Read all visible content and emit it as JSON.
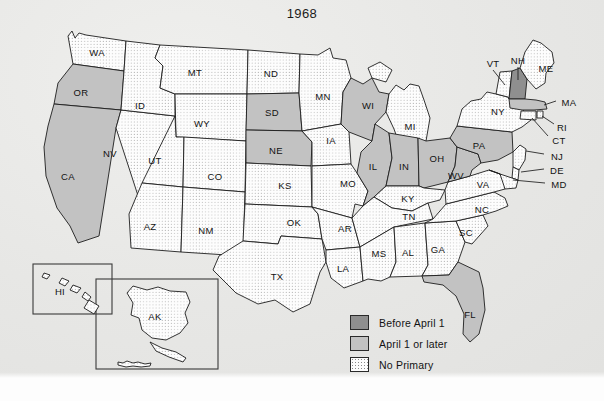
{
  "map": {
    "title": "1968",
    "legend": {
      "items": [
        {
          "label": "Before April 1",
          "swatch": "before",
          "color": "#8f8f8f"
        },
        {
          "label": "April 1 or later",
          "swatch": "after",
          "color": "#c2c2c2"
        },
        {
          "label": "No Primary",
          "swatch": "none",
          "color": "#fdfdfd"
        }
      ]
    },
    "categories": {
      "before_april_1": [
        "NH"
      ],
      "april_1_or_later": [
        "CA",
        "OR",
        "SD",
        "NE",
        "WI",
        "IL",
        "IN",
        "OH",
        "WV",
        "PA",
        "MA",
        "FL"
      ],
      "no_primary": [
        "WA",
        "ID",
        "MT",
        "ND",
        "MN",
        "WY",
        "NV",
        "UT",
        "CO",
        "KS",
        "IA",
        "MO",
        "AZ",
        "NM",
        "OK",
        "AR",
        "TX",
        "LA",
        "MS",
        "AL",
        "GA",
        "SC",
        "NC",
        "TN",
        "KY",
        "MI",
        "VA",
        "NY",
        "VT",
        "ME",
        "RI",
        "CT",
        "NJ",
        "DE",
        "MD",
        "AK",
        "HI"
      ]
    },
    "states": [
      {
        "code": "WA",
        "name": "Washington",
        "status": "no_primary",
        "x": 97,
        "y": 52
      },
      {
        "code": "OR",
        "name": "Oregon",
        "status": "april_1_or_later",
        "x": 81,
        "y": 92
      },
      {
        "code": "CA",
        "name": "California",
        "status": "april_1_or_later",
        "x": 68,
        "y": 176
      },
      {
        "code": "ID",
        "name": "Idaho",
        "status": "no_primary",
        "x": 140,
        "y": 105
      },
      {
        "code": "NV",
        "name": "Nevada",
        "status": "no_primary",
        "x": 110,
        "y": 153
      },
      {
        "code": "MT",
        "name": "Montana",
        "status": "no_primary",
        "x": 195,
        "y": 72
      },
      {
        "code": "WY",
        "name": "Wyoming",
        "status": "no_primary",
        "x": 202,
        "y": 123
      },
      {
        "code": "UT",
        "name": "Utah",
        "status": "no_primary",
        "x": 155,
        "y": 160
      },
      {
        "code": "AZ",
        "name": "Arizona",
        "status": "no_primary",
        "x": 150,
        "y": 226
      },
      {
        "code": "CO",
        "name": "Colorado",
        "status": "no_primary",
        "x": 215,
        "y": 176
      },
      {
        "code": "NM",
        "name": "New Mexico",
        "status": "no_primary",
        "x": 206,
        "y": 230
      },
      {
        "code": "ND",
        "name": "North Dakota",
        "status": "no_primary",
        "x": 271,
        "y": 73
      },
      {
        "code": "SD",
        "name": "South Dakota",
        "status": "april_1_or_later",
        "x": 272,
        "y": 112
      },
      {
        "code": "NE",
        "name": "Nebraska",
        "status": "april_1_or_later",
        "x": 276,
        "y": 150
      },
      {
        "code": "KS",
        "name": "Kansas",
        "status": "no_primary",
        "x": 285,
        "y": 185
      },
      {
        "code": "OK",
        "name": "Oklahoma",
        "status": "no_primary",
        "x": 294,
        "y": 222
      },
      {
        "code": "TX",
        "name": "Texas",
        "status": "no_primary",
        "x": 277,
        "y": 276
      },
      {
        "code": "MN",
        "name": "Minnesota",
        "status": "no_primary",
        "x": 323,
        "y": 96
      },
      {
        "code": "IA",
        "name": "Iowa",
        "status": "no_primary",
        "x": 331,
        "y": 140
      },
      {
        "code": "MO",
        "name": "Missouri",
        "status": "no_primary",
        "x": 348,
        "y": 183
      },
      {
        "code": "AR",
        "name": "Arkansas",
        "status": "no_primary",
        "x": 345,
        "y": 228
      },
      {
        "code": "LA",
        "name": "Louisiana",
        "status": "no_primary",
        "x": 343,
        "y": 268
      },
      {
        "code": "WI",
        "name": "Wisconsin",
        "status": "april_1_or_later",
        "x": 368,
        "y": 105
      },
      {
        "code": "MI",
        "name": "Michigan",
        "status": "no_primary",
        "x": 410,
        "y": 126
      },
      {
        "code": "IL",
        "name": "Illinois",
        "status": "april_1_or_later",
        "x": 373,
        "y": 166
      },
      {
        "code": "IN",
        "name": "Indiana",
        "status": "april_1_or_later",
        "x": 404,
        "y": 166
      },
      {
        "code": "OH",
        "name": "Ohio",
        "status": "april_1_or_later",
        "x": 437,
        "y": 158
      },
      {
        "code": "KY",
        "name": "Kentucky",
        "status": "no_primary",
        "x": 408,
        "y": 198
      },
      {
        "code": "TN",
        "name": "Tennessee",
        "status": "no_primary",
        "x": 409,
        "y": 216
      },
      {
        "code": "MS",
        "name": "Mississippi",
        "status": "no_primary",
        "x": 379,
        "y": 253
      },
      {
        "code": "AL",
        "name": "Alabama",
        "status": "no_primary",
        "x": 408,
        "y": 252
      },
      {
        "code": "GA",
        "name": "Georgia",
        "status": "no_primary",
        "x": 438,
        "y": 249
      },
      {
        "code": "FL",
        "name": "Florida",
        "status": "april_1_or_later",
        "x": 470,
        "y": 314
      },
      {
        "code": "SC",
        "name": "South Carolina",
        "status": "no_primary",
        "x": 466,
        "y": 232
      },
      {
        "code": "NC",
        "name": "North Carolina",
        "status": "no_primary",
        "x": 482,
        "y": 209
      },
      {
        "code": "VA",
        "name": "Virginia",
        "status": "no_primary",
        "x": 483,
        "y": 184
      },
      {
        "code": "WV",
        "name": "West Virginia",
        "status": "april_1_or_later",
        "x": 456,
        "y": 175
      },
      {
        "code": "PA",
        "name": "Pennsylvania",
        "status": "april_1_or_later",
        "x": 479,
        "y": 145
      },
      {
        "code": "NY",
        "name": "New York",
        "status": "no_primary",
        "x": 498,
        "y": 111
      },
      {
        "code": "VT",
        "name": "Vermont",
        "status": "no_primary",
        "x": 493,
        "y": 63
      },
      {
        "code": "NH",
        "name": "New Hampshire",
        "status": "before_april_1",
        "x": 518,
        "y": 60
      },
      {
        "code": "ME",
        "name": "Maine",
        "status": "no_primary",
        "x": 546,
        "y": 68
      },
      {
        "code": "MA",
        "name": "Massachusetts",
        "status": "april_1_or_later",
        "x": 569,
        "y": 102
      },
      {
        "code": "RI",
        "name": "Rhode Island",
        "status": "no_primary",
        "x": 562,
        "y": 127
      },
      {
        "code": "CT",
        "name": "Connecticut",
        "status": "no_primary",
        "x": 559,
        "y": 140
      },
      {
        "code": "NJ",
        "name": "New Jersey",
        "status": "no_primary",
        "x": 557,
        "y": 156
      },
      {
        "code": "DE",
        "name": "Delaware",
        "status": "no_primary",
        "x": 557,
        "y": 170
      },
      {
        "code": "MD",
        "name": "Maryland",
        "status": "no_primary",
        "x": 559,
        "y": 184
      },
      {
        "code": "HI",
        "name": "Hawaii",
        "status": "no_primary",
        "x": 60,
        "y": 291
      },
      {
        "code": "AK",
        "name": "Alaska",
        "status": "no_primary",
        "x": 155,
        "y": 316
      }
    ]
  }
}
